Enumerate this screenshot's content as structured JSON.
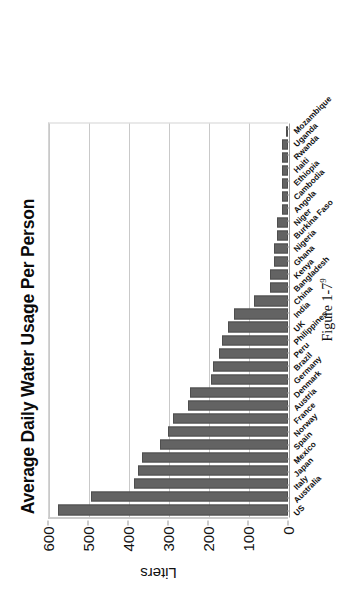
{
  "figure": {
    "caption_text": "Figure 1-7",
    "caption_superscript": "9"
  },
  "chart_data": {
    "type": "bar",
    "title": "Average Daily Water Usage Per Person",
    "xlabel": "",
    "ylabel": "Liters",
    "orientation": "vertical-bars-page-rotated-90ccw",
    "ylim": [
      0,
      600
    ],
    "yticks": [
      600,
      500,
      400,
      300,
      200,
      100,
      0
    ],
    "ytick_labels": [
      "600",
      "500",
      "400",
      "300",
      "200",
      "100",
      "0"
    ],
    "grid": true,
    "legend": "none",
    "bar_color": "#636363",
    "gridline_color": "#c9c9c9",
    "axis_color": "#9a9a9a",
    "categories": [
      "US",
      "Australia",
      "Italy",
      "Japan",
      "Mexico",
      "Spain",
      "Norway",
      "France",
      "Austria",
      "Denmark",
      "Germany",
      "Brazil",
      "Peru",
      "Philippines",
      "UK",
      "India",
      "China",
      "Bangladesh",
      "Kenya",
      "Ghana",
      "Nigeria",
      "Burkina Faso",
      "Niger",
      "Angola",
      "Cambodia",
      "Ethiopia",
      "Haiti",
      "Rwanda",
      "Uganda",
      "Mozambique"
    ],
    "values": [
      575,
      493,
      386,
      374,
      366,
      320,
      301,
      287,
      250,
      246,
      193,
      187,
      173,
      164,
      149,
      135,
      86,
      46,
      46,
      36,
      36,
      27,
      27,
      15,
      15,
      15,
      15,
      15,
      15,
      4
    ]
  }
}
